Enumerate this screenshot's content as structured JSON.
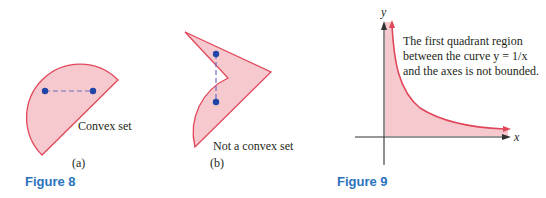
{
  "colors": {
    "fill": "#f6c9cf",
    "stroke": "#e0475a",
    "point": "#1f45a8",
    "dash": "#6b6fc0",
    "axis": "#333333",
    "caption": "#2a73bd",
    "text": "#231f20"
  },
  "figure8": {
    "caption": "Figure 8",
    "panel_a": {
      "sublabel": "(a)",
      "label": "Convex set"
    },
    "panel_b": {
      "sublabel": "(b)",
      "label": "Not a convex set"
    }
  },
  "figure9": {
    "caption": "Figure 9",
    "x_axis_label": "x",
    "y_axis_label": "y",
    "annotation": {
      "line1": "The first quadrant region",
      "line2": "between the curve y = 1/x",
      "line3": "and the axes is not bounded."
    }
  }
}
